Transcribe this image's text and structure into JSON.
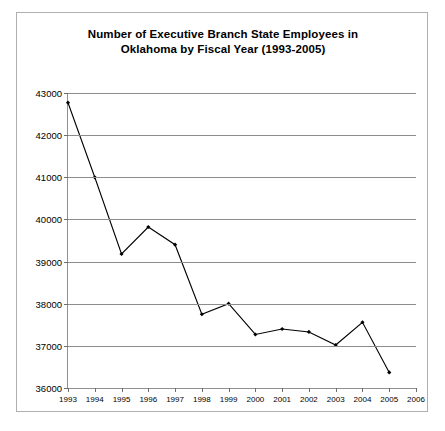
{
  "chart_data": {
    "type": "line",
    "title": "Number of Executive Branch State Employees in Oklahoma by Fiscal Year (1993-2005)",
    "title_line1": "Number of Executive Branch State Employees in",
    "title_line2": "Oklahoma by Fiscal Year (1993-2005)",
    "xlabel": "",
    "ylabel": "",
    "grid": true,
    "legend": "none",
    "marker": "diamond",
    "line_color": "#000000",
    "grid_color": "#8c8c8c",
    "axis_color": "#909090",
    "categories": [
      1993,
      1994,
      1995,
      1996,
      1997,
      1998,
      1999,
      2000,
      2001,
      2002,
      2003,
      2004,
      2005
    ],
    "values": [
      42770,
      41000,
      39180,
      39820,
      39400,
      37750,
      38000,
      37270,
      37400,
      37330,
      37020,
      37560,
      36370
    ],
    "xlim": [
      1993,
      2006
    ],
    "ylim": [
      36000,
      43000
    ],
    "ytick_labels": [
      "43000",
      "42000",
      "41000",
      "40000",
      "39000",
      "38000",
      "37000",
      "36000"
    ],
    "ytick_values": [
      43000,
      42000,
      41000,
      40000,
      39000,
      38000,
      37000,
      36000
    ],
    "xtick_labels": [
      "1993",
      "1994",
      "1995",
      "1996",
      "1997",
      "1998",
      "1999",
      "2000",
      "2001",
      "2002",
      "2003",
      "2004",
      "2005",
      "2006"
    ],
    "xtick_values": [
      1993,
      1994,
      1995,
      1996,
      1997,
      1998,
      1999,
      2000,
      2001,
      2002,
      2003,
      2004,
      2005,
      2006
    ]
  }
}
